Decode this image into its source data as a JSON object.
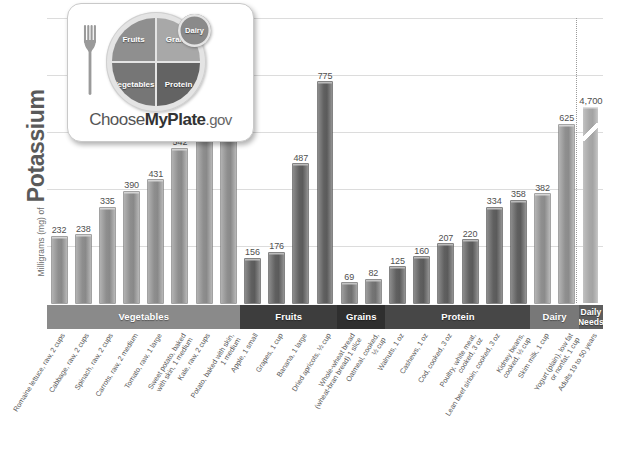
{
  "yaxis": {
    "prefix": "Milligrams (mg) of",
    "nutrient": "Potassium"
  },
  "logo": {
    "name": "myplate-logo",
    "wordmark_choose": "Choose",
    "wordmark_myplate": "MyPlate",
    "wordmark_gov": ".gov",
    "segments": {
      "fruits": "Fruits",
      "grains": "Grains",
      "vegetables": "Vegetables",
      "protein": "Protein",
      "dairy": "Dairy"
    }
  },
  "chart_data": {
    "type": "bar",
    "title": "",
    "xlabel": "",
    "ylabel": "Milligrams (mg) of Potassium",
    "ylim": [
      0,
      1000
    ],
    "grid": true,
    "gridlines": [
      200,
      400,
      600,
      800,
      1000
    ],
    "legend": "none",
    "axis_break_note": "Daily Needs bar is drawn with a broken axis; its true value is 4,700 mg",
    "categories": [
      "Romaine lettuce, raw, 2 cups",
      "Cabbage, raw, 2 cups",
      "Spinach, raw, 2 cups",
      "Carrots, raw, 2 medium",
      "Tomato, raw, 1 large",
      "Sweet potato, baked\nwith skin, 1 medium",
      "Kale, raw, 2 cups",
      "Potato, baked with skin,\n1 medium",
      "Apple, 1 small",
      "Grapes, 1 cup",
      "Banana, 1 large",
      "Dried apricots, ½ cup",
      "Whole-wheat bread\n(wheat-bran bread) 1 slice",
      "Oatmeal, cooked,\n½ cup",
      "Walnuts, 1 oz",
      "Cashews, 1 oz",
      "Cod, cooked, 3 oz",
      "Poultry, white meat,\ncooked, 3 oz",
      "Lean beef sirloin, cooked, 3 oz",
      "Kidney beans,\ncooked, ½ cup",
      "Skim milk, 1 cup",
      "Yogurt (plain), low fat\nor nonfat, 1 cup",
      "Adults 19 to 50 years"
    ],
    "values": [
      232,
      238,
      335,
      390,
      431,
      542,
      658,
      926,
      156,
      176,
      487,
      775,
      69,
      82,
      125,
      160,
      207,
      220,
      334,
      358,
      382,
      625,
      4700
    ],
    "value_labels": [
      "232",
      "238",
      "335",
      "390",
      "431",
      "542",
      "658",
      "926",
      "156",
      "176",
      "487",
      "775",
      "69",
      "82",
      "125",
      "160",
      "207",
      "220",
      "334",
      "358",
      "382",
      "625",
      "4,700"
    ],
    "groups": [
      {
        "label": "Vegetables",
        "count": 8,
        "color": "#8a8a8a"
      },
      {
        "label": "Fruits",
        "count": 4,
        "color": "#3d3d3d"
      },
      {
        "label": "Grains",
        "count": 2,
        "color": "#2f2f2f"
      },
      {
        "label": "Protein",
        "count": 6,
        "color": "#474747"
      },
      {
        "label": "Dairy",
        "count": 2,
        "color": "#787878"
      },
      {
        "label": "Daily\nNeeds",
        "count": 1,
        "color": "#5e5e5e"
      }
    ]
  }
}
